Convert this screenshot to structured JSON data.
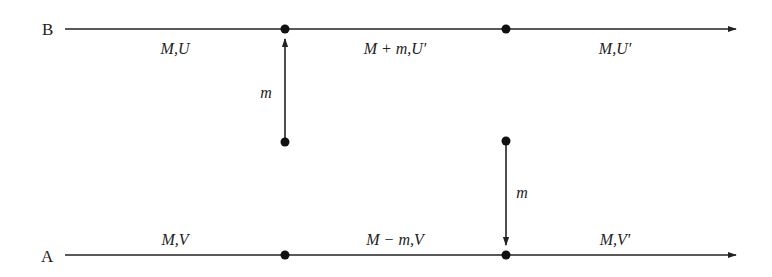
{
  "diagram": {
    "type": "mass-transfer-between-bodies",
    "lines": [
      {
        "id": "B",
        "label": "B",
        "segments": [
          {
            "label": "M,U"
          },
          {
            "label": "M + m,U′"
          },
          {
            "label": "M,U′"
          }
        ]
      },
      {
        "id": "A",
        "label": "A",
        "segments": [
          {
            "label": "M,V"
          },
          {
            "label": "M − m,V"
          },
          {
            "label": "M,V′"
          }
        ]
      }
    ],
    "transfers": [
      {
        "label": "m",
        "direction": "up",
        "to": "B"
      },
      {
        "label": "m",
        "direction": "down",
        "to": "A"
      }
    ],
    "colors": {
      "line": "#222222",
      "background": "#ffffff"
    }
  }
}
